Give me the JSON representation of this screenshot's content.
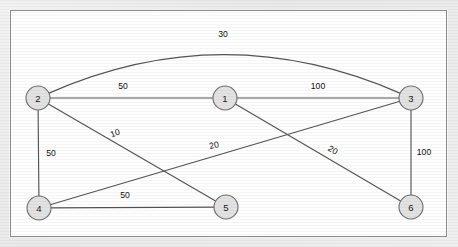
{
  "figure": {
    "type": "weighted-undirected-graph",
    "background_color": "#ececec",
    "panel_color": "#fefefe",
    "panel_border_color": "#8d8d8d",
    "node_fill": "#e2e2e2",
    "node_stroke": "#6f6f6f",
    "edge_color": "#555555"
  },
  "chart_data": {
    "type": "diagram",
    "title": "",
    "nodes": [
      {
        "id": "1",
        "label": "1",
        "cx": 225,
        "cy": 98,
        "r": 12
      },
      {
        "id": "2",
        "label": "2",
        "cx": 38,
        "cy": 98,
        "r": 12
      },
      {
        "id": "3",
        "label": "3",
        "cx": 411,
        "cy": 98,
        "r": 12
      },
      {
        "id": "4",
        "label": "4",
        "cx": 39,
        "cy": 208,
        "r": 12
      },
      {
        "id": "5",
        "label": "5",
        "cx": 226,
        "cy": 207,
        "r": 12
      },
      {
        "id": "6",
        "label": "6",
        "cx": 411,
        "cy": 207,
        "r": 12
      }
    ],
    "edges": [
      {
        "from": "2",
        "to": "3",
        "weight": "30",
        "shape": "curve",
        "label_x": 223,
        "label_y": 34,
        "label_rotation": 0
      },
      {
        "from": "2",
        "to": "1",
        "weight": "50",
        "shape": "line",
        "label_x": 123,
        "label_y": 86,
        "label_rotation": 0
      },
      {
        "from": "1",
        "to": "3",
        "weight": "100",
        "shape": "line",
        "label_x": 318,
        "label_y": 86,
        "label_rotation": 0
      },
      {
        "from": "2",
        "to": "4",
        "weight": "50",
        "shape": "line",
        "label_x": 51,
        "label_y": 153,
        "label_rotation": 0
      },
      {
        "from": "2",
        "to": "5",
        "weight": "10",
        "shape": "line",
        "label_x": 115,
        "label_y": 133,
        "label_rotation": -19
      },
      {
        "from": "4",
        "to": "3",
        "weight": "20",
        "shape": "line",
        "label_x": 214,
        "label_y": 145,
        "label_rotation": -13
      },
      {
        "from": "1",
        "to": "6",
        "weight": "20",
        "shape": "line",
        "label_x": 333,
        "label_y": 150,
        "label_rotation": 31
      },
      {
        "from": "3",
        "to": "6",
        "weight": "100",
        "shape": "line",
        "label_x": 424,
        "label_y": 152,
        "label_rotation": 0
      },
      {
        "from": "4",
        "to": "5",
        "weight": "50",
        "shape": "line",
        "label_x": 125,
        "label_y": 195,
        "label_rotation": 0
      }
    ],
    "curve_control_point": {
      "x": 224,
      "y": 16
    }
  }
}
